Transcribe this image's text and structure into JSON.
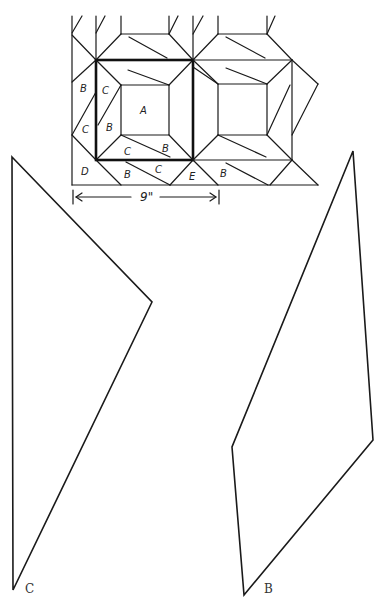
{
  "diagram": {
    "block_labels": {
      "A": "A",
      "B": "B",
      "C": "C",
      "D": "D",
      "E": "E"
    },
    "dimension": {
      "label": "9\"",
      "arrow": "double-headed horizontal"
    },
    "templates": [
      {
        "id": "C",
        "label": "C",
        "shape": "quadrilateral (kite-like)"
      },
      {
        "id": "B",
        "label": "B",
        "shape": "quadrilateral (parallelogram-like)"
      }
    ],
    "colors": {
      "line": "#1a1a1a",
      "background": "#ffffff"
    }
  }
}
